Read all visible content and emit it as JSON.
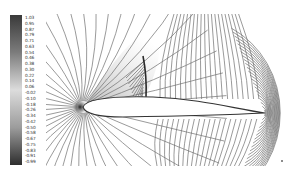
{
  "figure": {
    "colorbar": {
      "levels": [
        "1.03",
        "0.95",
        "0.87",
        "0.79",
        "0.71",
        "0.63",
        "0.54",
        "0.46",
        "0.38",
        "0.30",
        "0.22",
        "0.14",
        "0.06",
        "-0.02",
        "-0.10",
        "-0.18",
        "-0.26",
        "-0.34",
        "-0.42",
        "-0.50",
        "-0.58",
        "-0.67",
        "-0.75",
        "-0.83",
        "-0.91",
        "-0.99"
      ],
      "colors": {
        "top": "#3a3a3a",
        "upper_mid": "#8a8a8a",
        "middle": "#d8d8d8",
        "lower_mid": "#9a9a9a",
        "bottom": "#2e2e2e"
      }
    },
    "field": {
      "contour_color": "#6e6e6e",
      "airfoil_fill": "#ffffff",
      "airfoil_outline": "#333333",
      "features": [
        "leading-edge stagnation point",
        "upper-surface shock",
        "trailing edge"
      ]
    }
  }
}
